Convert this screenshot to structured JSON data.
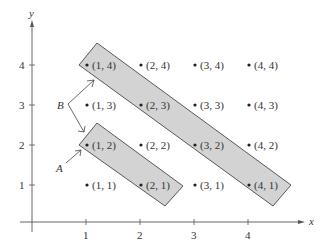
{
  "diagram": {
    "axes": {
      "x_label": "x",
      "y_label": "y",
      "x_ticks": [
        "1",
        "2",
        "3",
        "4"
      ],
      "y_ticks": [
        "1",
        "2",
        "3",
        "4"
      ]
    },
    "points": [
      {
        "label": "(1, 1)",
        "x": 1,
        "y": 1
      },
      {
        "label": "(2, 1)",
        "x": 2,
        "y": 1
      },
      {
        "label": "(3, 1)",
        "x": 3,
        "y": 1
      },
      {
        "label": "(4, 1)",
        "x": 4,
        "y": 1
      },
      {
        "label": "(1, 2)",
        "x": 1,
        "y": 2
      },
      {
        "label": "(2, 2)",
        "x": 2,
        "y": 2
      },
      {
        "label": "(3, 2)",
        "x": 3,
        "y": 2
      },
      {
        "label": "(4, 2)",
        "x": 4,
        "y": 2
      },
      {
        "label": "(1, 3)",
        "x": 1,
        "y": 3
      },
      {
        "label": "(2, 3)",
        "x": 2,
        "y": 3
      },
      {
        "label": "(3, 3)",
        "x": 3,
        "y": 3
      },
      {
        "label": "(4, 3)",
        "x": 4,
        "y": 3
      },
      {
        "label": "(1, 4)",
        "x": 1,
        "y": 4
      },
      {
        "label": "(2, 4)",
        "x": 2,
        "y": 4
      },
      {
        "label": "(3, 4)",
        "x": 3,
        "y": 4
      },
      {
        "label": "(4, 4)",
        "x": 4,
        "y": 4
      }
    ],
    "regions": [
      {
        "label": "A",
        "contains": [
          "(1, 2)",
          "(2, 1)"
        ]
      },
      {
        "label": "B",
        "contains": [
          "(1, 4)",
          "(2, 3)",
          "(3, 2)",
          "(4, 1)"
        ]
      }
    ],
    "colors": {
      "region_fill": "#d3d3d3",
      "stroke": "#333333",
      "background": "#ffffff"
    }
  }
}
